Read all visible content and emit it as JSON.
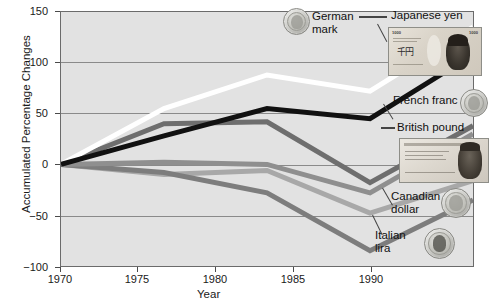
{
  "chart_data": {
    "type": "line",
    "title": "",
    "xlabel": "Year",
    "ylabel": "Accumulated Percentage Changes",
    "x": [
      1970,
      1975,
      1980,
      1985,
      1990
    ],
    "categories": [
      "1970",
      "1975",
      "1980",
      "1985",
      "1990"
    ],
    "xlim": [
      1970,
      1990
    ],
    "ylim": [
      -100,
      150
    ],
    "yticks": [
      -100,
      -50,
      0,
      50,
      100,
      150
    ],
    "ytick_labels": [
      "−100",
      "−50",
      "0",
      "50",
      "100",
      "150"
    ],
    "xticks": [
      1970,
      1975,
      1980,
      1985,
      1990
    ],
    "grid": "horizontal",
    "legend": "annotated-labels-right",
    "plot_background": "#e2e2e2",
    "series": [
      {
        "name": "German mark",
        "color": "#ffffff",
        "values": [
          0,
          55,
          88,
          72,
          135
        ]
      },
      {
        "name": "Japanese yen",
        "color": "#111111",
        "values": [
          0,
          28,
          55,
          45,
          108
        ]
      },
      {
        "name": "French franc",
        "color": "#6e6e6e",
        "values": [
          0,
          40,
          42,
          -18,
          38
        ]
      },
      {
        "name": "British pound",
        "color": "#8f8f8f",
        "values": [
          0,
          2,
          0,
          -28,
          30
        ]
      },
      {
        "name": "Canadian dollar",
        "color": "#a8a8a8",
        "values": [
          0,
          -10,
          -6,
          -48,
          -16
        ]
      },
      {
        "name": "Italian lira",
        "color": "#7d7d7d",
        "values": [
          0,
          -8,
          -28,
          -85,
          -35
        ]
      }
    ]
  },
  "axes": {
    "y_title": "Accumulated Percentage Changes",
    "x_title": "Year",
    "y_labels": [
      "150",
      "100",
      "50",
      "0",
      "−50",
      "−100"
    ],
    "x_labels": [
      "1970",
      "1975",
      "1980",
      "1985",
      "1990"
    ]
  },
  "annotations": [
    {
      "id": "german-mark",
      "line1": "German",
      "line2": "mark",
      "icon": "coin-german-mark"
    },
    {
      "id": "japanese-yen",
      "line1": "Japanese yen",
      "line2": "",
      "icon": "banknote-japanese-yen"
    },
    {
      "id": "french-franc",
      "line1": "French franc",
      "line2": "",
      "icon": "coin-french-franc"
    },
    {
      "id": "british-pound",
      "line1": "British pound",
      "line2": "",
      "icon": "banknote-british-pound"
    },
    {
      "id": "canadian-dollar",
      "line1": "Canadian",
      "line2": "dollar",
      "icon": "coin-canadian-dollar"
    },
    {
      "id": "italian-lira",
      "line1": "Italian",
      "line2": "lira",
      "icon": "coin-italian-lira"
    }
  ],
  "banknotes": {
    "yen_denomination_left": "1000",
    "yen_denomination_right": "1000",
    "yen_kanji": "千円"
  },
  "colors": {
    "plot_bg": "#e2e2e2",
    "grid": "#8a8a8a",
    "frame": "#6b6b6b",
    "text": "#1a1a1a"
  }
}
